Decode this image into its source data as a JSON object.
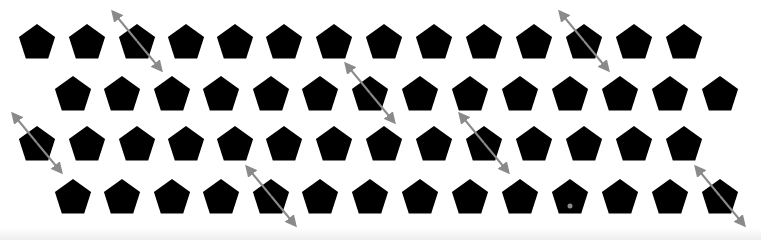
{
  "canvas": {
    "width": 761,
    "height": 240,
    "background": "#ffffff"
  },
  "style": {
    "shape_color": "#000000",
    "arrow_color": "#8a8a8a",
    "dot_color": "#8a8a8a",
    "shape_radius": 19,
    "arrow_dx": 24,
    "arrow_dy": 29
  },
  "stimulus": {
    "shape": "pentagon",
    "rows": [
      {
        "y": 41,
        "x": [
          37,
          87,
          137,
          186,
          235,
          284,
          334,
          384,
          434,
          484,
          534,
          584,
          634,
          684
        ],
        "arrows": [
          2,
          11
        ],
        "dots": []
      },
      {
        "y": 93,
        "x": [
          73,
          122,
          172,
          221,
          271,
          320,
          370,
          420,
          470,
          520,
          570,
          620,
          670,
          720
        ],
        "arrows": [
          6
        ],
        "dots": []
      },
      {
        "y": 143,
        "x": [
          37,
          87,
          137,
          186,
          235,
          284,
          334,
          384,
          434,
          484,
          534,
          584,
          634,
          684
        ],
        "arrows": [
          0,
          9
        ],
        "dots": []
      },
      {
        "y": 196,
        "x": [
          73,
          122,
          172,
          221,
          271,
          320,
          370,
          420,
          470,
          520,
          570,
          620,
          670,
          720
        ],
        "arrows": [
          4,
          13
        ],
        "dots": [
          10
        ]
      }
    ]
  }
}
